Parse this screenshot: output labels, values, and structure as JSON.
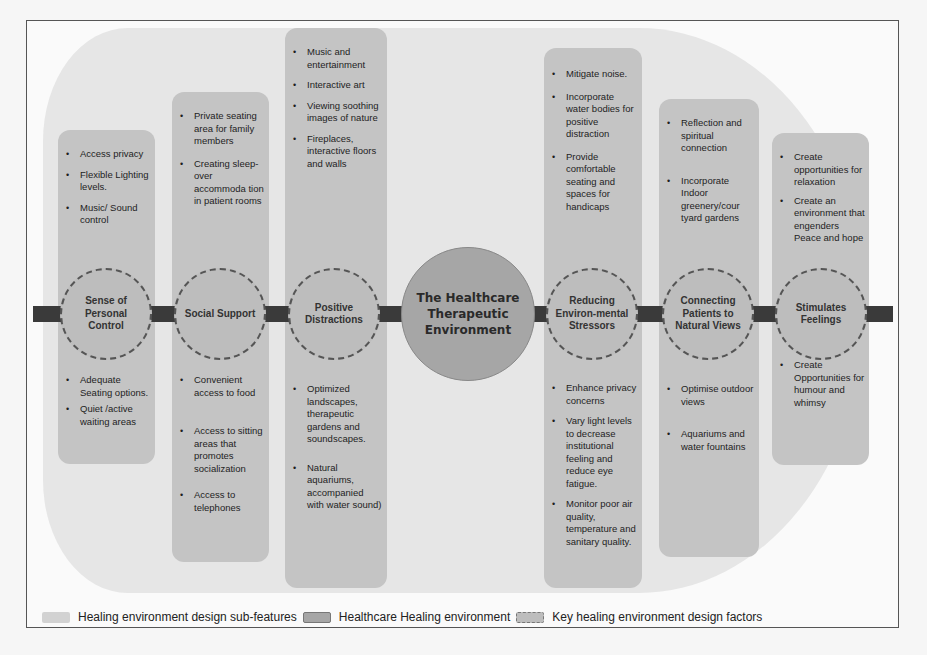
{
  "diagram": {
    "center": {
      "label": "The Healthcare Therapeutic Environment"
    },
    "factors": [
      {
        "label": "Sense of Personal Control",
        "top_items": [
          "Access privacy",
          "Flexible Lighting levels.",
          "Music/ Sound control"
        ],
        "bottom_items": [
          "Adequate Seating options.",
          "Quiet /active waiting areas"
        ]
      },
      {
        "label": "Social Support",
        "top_items": [
          "Private seating area for family members",
          "Creating sleep-over accommoda tion in patient rooms"
        ],
        "bottom_items": [
          "Convenient access to food",
          "Access to sitting areas that promotes socialization",
          "Access to telephones"
        ]
      },
      {
        "label": "Positive Distractions",
        "top_items": [
          "Music and entertainment",
          "Interactive art",
          "Viewing soothing images of nature",
          "Fireplaces, interactive floors and walls"
        ],
        "bottom_items": [
          "Optimized landscapes, therapeutic gardens and soundscapes.",
          "Natural aquariums, accompanied with water sound)"
        ]
      },
      {
        "label": "Reducing Environ-mental Stressors",
        "top_items": [
          "Mitigate noise.",
          "Incorporate water bodies for positive distraction",
          "Provide comfortable seating and spaces for handicaps"
        ],
        "bottom_items": [
          "Enhance privacy concerns",
          "Vary light levels to decrease institutional feeling and reduce eye fatigue.",
          "Monitor poor air quality, temperature and sanitary quality."
        ]
      },
      {
        "label": "Connecting Patients to Natural Views",
        "top_items": [
          "Reflection and spiritual connection",
          "Incorporate Indoor greenery/cour tyard gardens"
        ],
        "bottom_items": [
          "Optimise outdoor views",
          "Aquariums and water fountains"
        ]
      },
      {
        "label": "Stimulates Feelings",
        "top_items": [
          "Create opportunities for relaxation",
          "Create an environment that engenders Peace and hope"
        ],
        "bottom_items": [
          "Create Opportunities for humour and whimsy"
        ]
      }
    ],
    "legend": [
      {
        "label": "Healing environment design sub-features",
        "color": "#d2d2d2"
      },
      {
        "label": "Healthcare Healing environment",
        "color": "#a6a6a6"
      },
      {
        "label": "Key healing environment design factors",
        "color": "#bdbdbd"
      }
    ]
  }
}
